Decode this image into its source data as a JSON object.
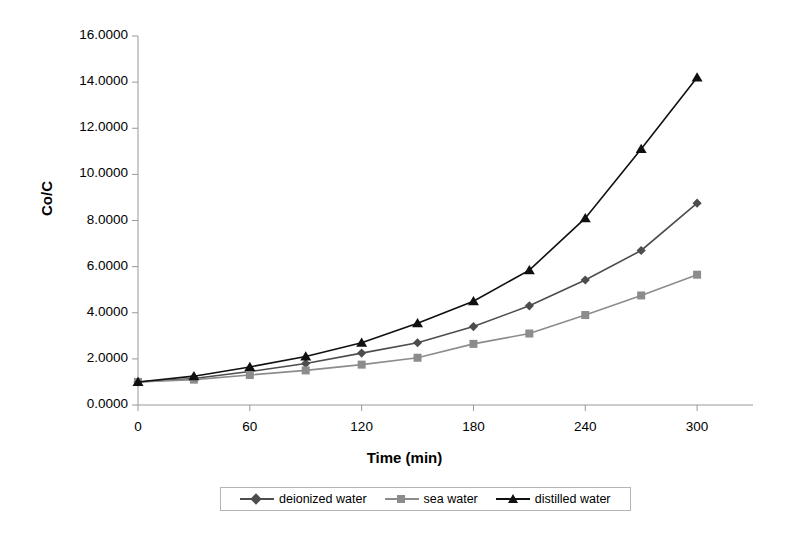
{
  "chart_data": {
    "type": "line",
    "title": "",
    "xlabel": "Time (min)",
    "ylabel": "Co/C",
    "x": [
      0,
      30,
      60,
      90,
      120,
      150,
      180,
      210,
      240,
      270,
      300
    ],
    "xlim": [
      0,
      330
    ],
    "ylim": [
      0.0,
      16.0
    ],
    "xticks": [
      "0",
      "60",
      "120",
      "180",
      "240",
      "300"
    ],
    "xtick_values": [
      0,
      60,
      120,
      180,
      240,
      300
    ],
    "yticks": [
      "0.0000",
      "2.0000",
      "4.0000",
      "6.0000",
      "8.0000",
      "10.0000",
      "12.0000",
      "14.0000",
      "16.0000"
    ],
    "ytick_values": [
      0,
      2,
      4,
      6,
      8,
      10,
      12,
      14,
      16
    ],
    "grid": false,
    "legend_position": "bottom",
    "series": [
      {
        "name": "deionized water",
        "marker": "diamond",
        "color": "#4d4d4d",
        "values": [
          1.0,
          1.15,
          1.45,
          1.8,
          2.25,
          2.7,
          3.4,
          4.3,
          5.42,
          6.7,
          8.75
        ]
      },
      {
        "name": "sea water",
        "marker": "square",
        "color": "#8c8c8c",
        "values": [
          1.0,
          1.1,
          1.3,
          1.5,
          1.75,
          2.05,
          2.65,
          3.1,
          3.9,
          4.75,
          5.65
        ]
      },
      {
        "name": "distilled water",
        "marker": "triangle",
        "color": "#101010",
        "values": [
          1.0,
          1.25,
          1.65,
          2.1,
          2.7,
          3.55,
          4.5,
          5.85,
          8.1,
          11.1,
          14.2
        ]
      }
    ]
  },
  "legend": {
    "entries": [
      {
        "label": "deionized water",
        "marker": "diamond",
        "color": "#4d4d4d"
      },
      {
        "label": "sea water",
        "marker": "square",
        "color": "#8c8c8c"
      },
      {
        "label": "distilled water",
        "marker": "triangle",
        "color": "#101010"
      }
    ]
  },
  "axes": {
    "y_title": "Co/C",
    "x_title": "Time (min)",
    "axis_color": "#999999"
  }
}
